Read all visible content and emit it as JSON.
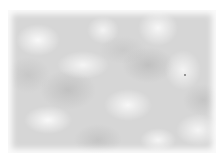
{
  "image": {
    "description": "Soft gray cloud-like noise texture on white background",
    "width": 223,
    "height": 161,
    "colors": {
      "background": "#ffffff",
      "base_gray": "#d6d6d6",
      "light_patch": "#ffffff",
      "dark_patch": "#b4b4b4",
      "speck": "#777777"
    },
    "speck_position": {
      "x": 184,
      "y": 74
    }
  }
}
